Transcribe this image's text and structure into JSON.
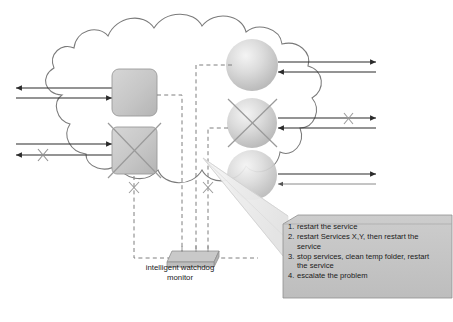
{
  "diagram": {
    "type": "network-cloud-monitoring-diagram",
    "background_color": "#ffffff",
    "line_color": "#6b6b6b",
    "arrow_color": "#2b2b2b",
    "device_fill": "#c9c9c9",
    "device_stroke": "#8a8a8a",
    "callout_fill": "#c4c4c4",
    "callout_stroke": "#8f8f8f",
    "cone_fill": "#ededed"
  },
  "cloud": {
    "name": "network-cloud",
    "stroke": "#7a7a7a"
  },
  "devices": {
    "servers": [
      {
        "name": "server-box-top",
        "shape": "rounded-square",
        "failed": false
      },
      {
        "name": "server-box-bottom",
        "shape": "rounded-square",
        "failed": true
      }
    ],
    "services": [
      {
        "name": "service-sphere-top",
        "shape": "sphere",
        "failed": false
      },
      {
        "name": "service-sphere-middle",
        "shape": "sphere",
        "failed": true
      },
      {
        "name": "service-sphere-bottom",
        "shape": "sphere",
        "failed": false
      }
    ],
    "monitor": {
      "name": "intelligent-watchdog-monitor",
      "label_line_1": "intelligent watchdog",
      "label_line_2": "monitor"
    }
  },
  "fault_markers": [
    {
      "name": "fault-x-left-outgoing-arrow"
    },
    {
      "name": "fault-x-server-box-bottom"
    },
    {
      "name": "fault-x-service-sphere-middle"
    },
    {
      "name": "fault-x-right-arrow-middle"
    },
    {
      "name": "fault-x-dashed-link-server-bottom"
    },
    {
      "name": "fault-x-dashed-link-sphere-middle"
    }
  ],
  "callout": {
    "title": "",
    "items": [
      {
        "num": "1.",
        "text": "restart the service"
      },
      {
        "num": "2.",
        "text": "restart Services X,Y, then restart the service"
      },
      {
        "num": "3.",
        "text": "stop services, clean temp folder, restart the service"
      },
      {
        "num": "4.",
        "text": "escalate the problem"
      }
    ]
  },
  "caption": {
    "text": ""
  }
}
